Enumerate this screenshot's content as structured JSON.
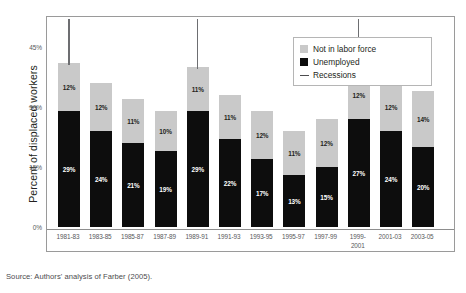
{
  "chart_data": {
    "type": "bar",
    "subtype": "stacked-bar",
    "title": "",
    "xlabel": "",
    "ylabel": "Percent of displaced workers",
    "ylim": [
      0,
      45
    ],
    "yticks": [
      "0%",
      "15%",
      "30%",
      "45%"
    ],
    "ytick_values": [
      0,
      15,
      30,
      45
    ],
    "grid": false,
    "legend_position": "top-right",
    "categories": [
      "1981-83",
      "1983-85",
      "1985-87",
      "1987-89",
      "1989-91",
      "1991-93",
      "1993-95",
      "1995-97",
      "1997-99",
      "1999-\n2001",
      "2001-03",
      "2003-05"
    ],
    "series": [
      {
        "name": "Unemployed",
        "color": "#0d0d0d",
        "values": [
          29,
          24,
          21,
          19,
          29,
          22,
          17,
          13,
          15,
          27,
          24,
          20
        ],
        "labels": [
          "29%",
          "24%",
          "21%",
          "19%",
          "29%",
          "22%",
          "17%",
          "13%",
          "15%",
          "27%",
          "24%",
          "20%"
        ]
      },
      {
        "name": "Not in labor force",
        "color": "#c9c9c9",
        "values": [
          12,
          12,
          11,
          10,
          11,
          11,
          12,
          11,
          12,
          12,
          12,
          14
        ],
        "labels": [
          "12%",
          "12%",
          "11%",
          "10%",
          "11%",
          "11%",
          "12%",
          "11%",
          "12%",
          "12%",
          "12%",
          "14%"
        ]
      }
    ],
    "totals": [
      41,
      36,
      32,
      29,
      40,
      33,
      29,
      24,
      27,
      39,
      36,
      34
    ],
    "annotations": {
      "recessions": {
        "label": "Recessions",
        "marked_categories": [
          "1981-83",
          "1989-91",
          "1999-\n2001"
        ]
      }
    }
  },
  "legend": {
    "items": [
      {
        "label": "Not in labor force",
        "swatch": "gray-square-icon",
        "color": "#c9c9c9"
      },
      {
        "label": "Unemployed",
        "swatch": "black-square-icon",
        "color": "#0d0d0d"
      },
      {
        "label": "Recessions",
        "swatch": "line-marker-icon",
        "color": "#4d4d4f"
      }
    ]
  },
  "source": {
    "text": "Source: Authors' analysis of Farber (2005)."
  }
}
